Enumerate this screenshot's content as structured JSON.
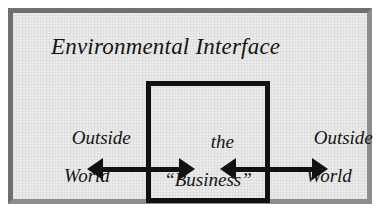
{
  "diagram": {
    "title": "Environmental Interface",
    "center_box": {
      "line1": "the",
      "line2": "“Business”"
    },
    "left_region": {
      "line1": "Outside",
      "line2": "World"
    },
    "right_region": {
      "line1": "Outside",
      "line2": "World"
    },
    "connectors": [
      {
        "name": "left-interface-arrow",
        "style": "double-headed"
      },
      {
        "name": "right-interface-arrow",
        "style": "double-headed"
      }
    ],
    "colors": {
      "frame_border": "#6f6f6f",
      "panel_background": "#ebebeb",
      "box_border": "#111111",
      "arrow": "#111111",
      "text": "#141414"
    }
  }
}
